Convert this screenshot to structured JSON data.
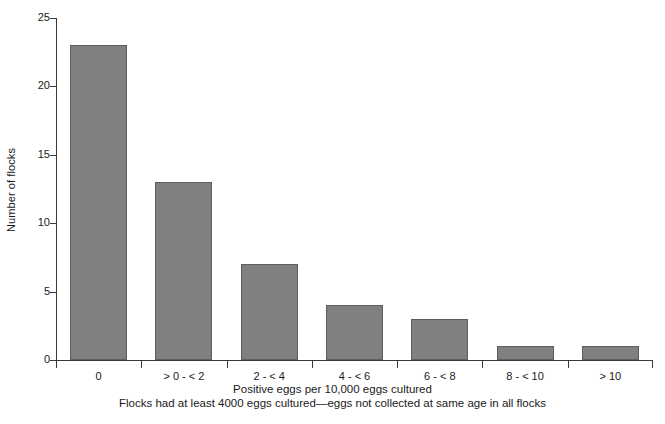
{
  "chart_data": {
    "type": "bar",
    "title": "",
    "categories": [
      "0",
      "> 0 - < 2",
      "2 - < 4",
      "4 - < 6",
      "6 - < 8",
      "8 - < 10",
      "> 10"
    ],
    "values": [
      23,
      13,
      7,
      4,
      3,
      1,
      1
    ],
    "xlabel": "Positive eggs per 10,000 eggs cultured",
    "ylabel": "Number of flocks",
    "ylim": [
      0,
      25
    ],
    "yticks": [
      0,
      5,
      10,
      15,
      20,
      25
    ],
    "ytick_labels": [
      "0",
      "5",
      "10",
      "15",
      "20",
      "25"
    ],
    "grid": false,
    "legend": "none",
    "annotations": [
      "Flocks had at least 4000 eggs cultured—eggs not collected at same age in all flocks"
    ],
    "bar_color": "#808080",
    "bar_edge_color": "#5e5e5e",
    "axis_color": "#3a3a3a",
    "background": "#ffffff"
  },
  "footnote": "Flocks had at least 4000 eggs cultured—eggs not collected at same age in all flocks"
}
